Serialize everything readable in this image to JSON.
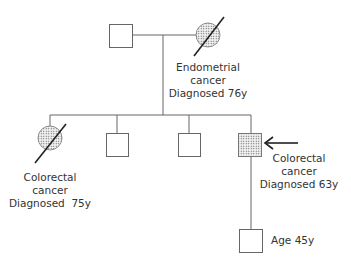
{
  "diagram": {
    "type": "pedigree",
    "colors": {
      "line": "#555555",
      "stroke": "#666666",
      "stipple": "#555555",
      "text": "#333333"
    },
    "generation1": {
      "father": {
        "sex": "male",
        "affected": false
      },
      "mother": {
        "sex": "female",
        "affected": true,
        "deceased": true,
        "label": {
          "line1": "Endometrial",
          "line2": "cancer",
          "line3": "Diagnosed 76y"
        }
      }
    },
    "generation2": [
      {
        "sex": "female",
        "affected": true,
        "deceased": true,
        "label": {
          "line1": "Colorectal",
          "line2": "cancer",
          "line3": "Diagnosed  75y"
        }
      },
      {
        "sex": "male",
        "affected": false
      },
      {
        "sex": "male",
        "affected": false
      },
      {
        "sex": "male",
        "affected": true,
        "proband": true,
        "label": {
          "line1": "Colorectal",
          "line2": "cancer",
          "line3": "Diagnosed 63y"
        }
      }
    ],
    "generation3": [
      {
        "sex": "male",
        "affected": false,
        "label": {
          "line1": "Age 45y"
        }
      }
    ]
  }
}
